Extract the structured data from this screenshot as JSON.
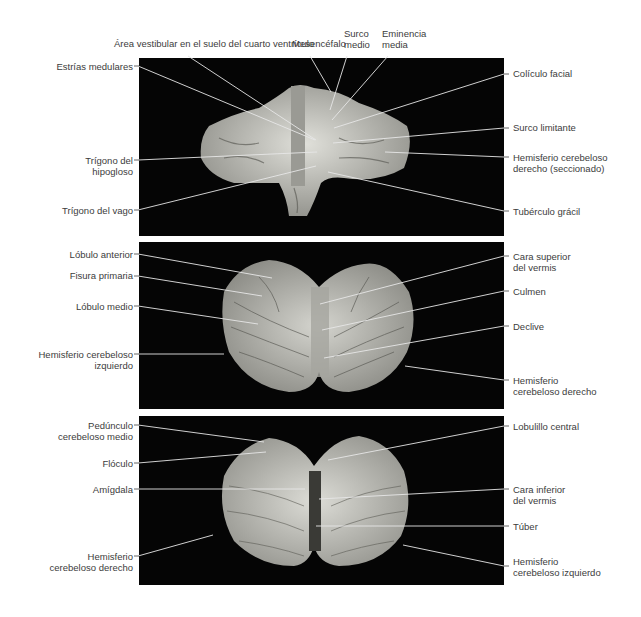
{
  "figure": {
    "panels": [
      {
        "id": "floor-fourth-ventricle",
        "labels_top": [
          "Área vestibular en el suelo del cuarto ventrículo",
          "Mesencéfalo",
          "Surco\nmedio",
          "Eminencia\nmedia"
        ],
        "labels_left": [
          "Estrías medulares",
          "Trígono del\nhipogloso",
          "Trígono del vago"
        ],
        "labels_right": [
          "Colículo facial",
          "Surco limitante",
          "Hemisferio cerebeloso\nderecho (seccionado)",
          "Tubérculo grácil"
        ]
      },
      {
        "id": "superior-view",
        "labels_left": [
          "Lóbulo anterior",
          "Fisura primaria",
          "Lóbulo medio",
          "Hemisferio cerebeloso\nizquierdo"
        ],
        "labels_right": [
          "Cara superior\ndel vermis",
          "Culmen",
          "Declive",
          "Hemisferio\ncerebeloso derecho"
        ]
      },
      {
        "id": "inferior-view",
        "labels_left": [
          "Pedúnculo\ncerebeloso medio",
          "Flóculo",
          "Amígdala",
          "Hemisferio\ncerebeloso derecho"
        ],
        "labels_right": [
          "Lobulillo central",
          "Cara inferior\ndel vermis",
          "Túber",
          "Hemisferio\ncerebeloso izquierdo"
        ]
      }
    ],
    "colors": {
      "background": "#ffffff",
      "panel": "#050505",
      "text": "#3c3c3c",
      "leader_line": "#e8e8e8",
      "tissue": "#c9c9c3"
    }
  }
}
